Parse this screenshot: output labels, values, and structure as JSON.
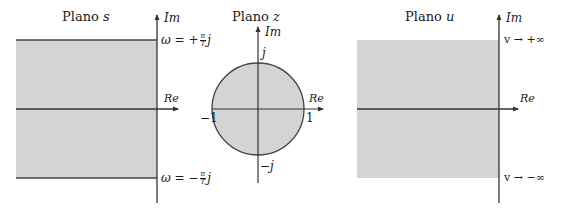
{
  "figure": {
    "colors": {
      "region_fill": "#d4d4d4",
      "axis": "#333333",
      "boundary": "#444444",
      "text": "#1a1a1a",
      "background": "#ffffff"
    },
    "panels": [
      {
        "id": "s",
        "title_prefix": "Plano ",
        "title_var": "s",
        "axis_labels": {
          "im": "Im",
          "re": "Re"
        },
        "annotations": {
          "top_prefix": "ω = +",
          "top_frac_num": "π",
          "top_frac_den": "T",
          "top_suffix": "j",
          "bottom_prefix": "ω = −",
          "bottom_frac_num": "π",
          "bottom_frac_den": "T",
          "bottom_suffix": "j"
        },
        "region": "horizontal strip between ω = −π/T and ω = +π/T, left half-plane"
      },
      {
        "id": "z",
        "title_prefix": "Plano ",
        "title_var": "z",
        "axis_labels": {
          "im": "Im",
          "re": "Re"
        },
        "annotations": {
          "top": "j",
          "bottom": "−j",
          "left": "−1",
          "right": "1"
        },
        "region": "unit circle interior"
      },
      {
        "id": "u",
        "title_prefix": "Plano ",
        "title_var": "u",
        "axis_labels": {
          "im": "Im",
          "re": "Re"
        },
        "annotations": {
          "top": "v → +∞",
          "bottom": "v → −∞"
        },
        "region": "left half-plane"
      }
    ]
  }
}
